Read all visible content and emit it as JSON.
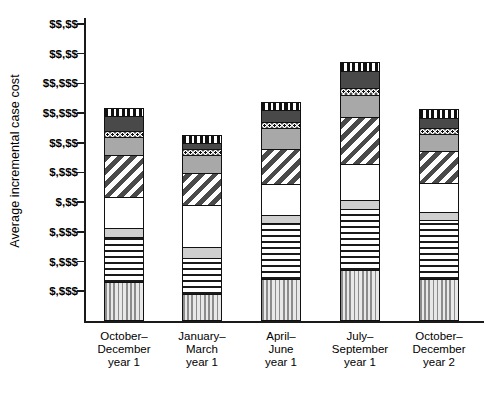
{
  "chart_data": {
    "type": "bar",
    "subtype": "stacked",
    "title": "",
    "xlabel": "",
    "ylabel": "Average incremental case cost",
    "grid": false,
    "legend_position": "none",
    "note": "Y-axis tick labels are redacted/masked in the source image, shown as dollar-sign placeholders.",
    "categories": [
      "October–December year 1",
      "January–March year 1",
      "April–June year 1",
      "July–September year 1",
      "October–December year 2"
    ],
    "category_lines": [
      [
        "October–",
        "December",
        "year 1"
      ],
      [
        "January–",
        "March",
        "year 1"
      ],
      [
        "April–",
        "June",
        "year 1"
      ],
      [
        "July–",
        "September",
        "year 1"
      ],
      [
        "October–",
        "December",
        "year 2"
      ]
    ],
    "ytick_labels": [
      "$$,$$",
      "$$,$$",
      "$$,$$$",
      "$$,$$$",
      "$$,$$",
      "$,$$$",
      "$,$$",
      "$,$$$",
      "$,$$$",
      "$,$$$"
    ],
    "ytick_values": [
      10,
      9,
      8,
      7,
      6,
      5,
      4,
      3,
      2,
      1
    ],
    "ylim": [
      0,
      10.2
    ],
    "series": [
      {
        "name": "segment-1-vertical-stripe-dense",
        "pattern": "vertical-stripe-dense",
        "values": [
          1.32,
          0.92,
          1.42,
          1.72,
          1.42
        ]
      },
      {
        "name": "segment-2-horizontal-stripe",
        "pattern": "horizontal-stripe",
        "values": [
          1.55,
          1.22,
          1.9,
          2.1,
          2.0
        ]
      },
      {
        "name": "segment-3-light-gray",
        "pattern": "light-gray-solid",
        "values": [
          0.32,
          0.42,
          0.3,
          0.32,
          0.32
        ]
      },
      {
        "name": "segment-4-white",
        "pattern": "white-solid",
        "values": [
          1.1,
          1.45,
          1.1,
          1.25,
          1.02
        ]
      },
      {
        "name": "segment-5-diagonal-stripe",
        "pattern": "diagonal-stripe",
        "values": [
          1.45,
          1.1,
          1.22,
          1.62,
          1.1
        ]
      },
      {
        "name": "segment-6-medium-gray",
        "pattern": "medium-gray-solid",
        "values": [
          0.62,
          0.65,
          0.72,
          0.78,
          0.62
        ]
      },
      {
        "name": "segment-7-dotted",
        "pattern": "dotted",
        "values": [
          0.25,
          0.22,
          0.25,
          0.25,
          0.22
        ]
      },
      {
        "name": "segment-8-dark-gray",
        "pattern": "dark-gray-solid",
        "values": [
          0.52,
          0.25,
          0.42,
          0.62,
          0.38
        ]
      },
      {
        "name": "segment-9-vertical-stripe-bold",
        "pattern": "vertical-stripe-bold",
        "values": [
          0.3,
          0.3,
          0.3,
          0.32,
          0.32
        ]
      }
    ],
    "totals": [
      7.43,
      6.53,
      7.63,
      8.98,
      7.4
    ]
  },
  "axis": {
    "y_title": "Average incremental case cost"
  }
}
